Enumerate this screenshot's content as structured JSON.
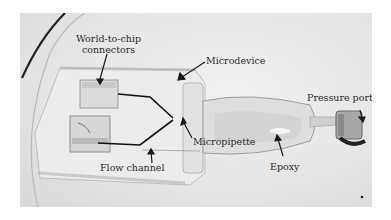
{
  "figure": {
    "labels": {
      "world_to_chip_line1": "World-to-chip",
      "world_to_chip_line2": "connectors",
      "microdevice": "Microdevice",
      "pressure_port": "Pressure port",
      "micropipette": "Micropipette",
      "flow_channel": "Flow channel",
      "epoxy": "Epoxy"
    },
    "colors": {
      "background": "#ffffff",
      "photo_base": "#e6e6e6",
      "annotation": "#1a1a1a",
      "flow_channel_lines": "#111111"
    }
  }
}
